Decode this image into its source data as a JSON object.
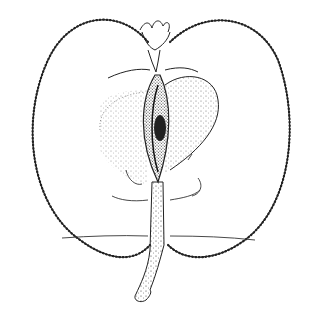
{
  "image": {
    "subject": "apple longitudinal cross-section line drawing",
    "background": "#ffffff",
    "ink": "#222222",
    "parts": [
      "skin-outline",
      "calyx",
      "core",
      "seed",
      "flesh-stipple",
      "vascular-bundles",
      "stem"
    ]
  }
}
